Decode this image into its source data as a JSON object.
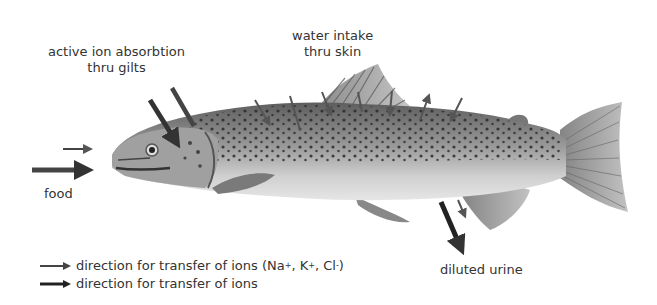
{
  "diagram": {
    "labels": {
      "gills": [
        "active ion absorbtion",
        "thru gilts"
      ],
      "skin": [
        "water intake",
        "thru skin"
      ],
      "food": "food",
      "urine": "diluted urine"
    },
    "legend": [
      {
        "text": "direction for transfer of ions (Na",
        "ions": [
          {
            "sym": "Na",
            "charge": "+"
          },
          {
            "sym": "K",
            "charge": "+"
          },
          {
            "sym": "Cl",
            "charge": "-"
          }
        ],
        "arrow": "thin"
      },
      {
        "text": "direction for transfer of ions",
        "arrow": "thick"
      }
    ],
    "legend_line1": {
      "prefix": "direction for transfer of ions (Na",
      "k": ", K",
      "cl": ", Cl",
      "close": ")",
      "plus": "+",
      "minus": "-"
    },
    "legend_line2": "direction for transfer of ions",
    "colors": {
      "thick_arrow": "#333333",
      "thin_arrow": "#555555",
      "fish_body": "#8a8a8a",
      "fish_belly": "#d0d0d0",
      "spots": "#2a2a2a"
    }
  }
}
